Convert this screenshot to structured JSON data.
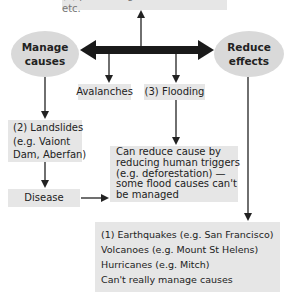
{
  "top_box": {
    "text": "(4) preventing causes of famine etc."
  },
  "nodes": {
    "manage_causes": {
      "line1": "Manage",
      "line2": "causes"
    },
    "reduce_effects": {
      "line1": "Reduce",
      "line2": "effects"
    },
    "avalanches": {
      "text": "Avalanches"
    },
    "flooding": {
      "text": "(3) Flooding"
    },
    "landslides": {
      "lines": [
        "(2) Landslides",
        "(e.g. Vaiont",
        "Dam, Aberfan)"
      ]
    },
    "disease": {
      "text": "Disease"
    },
    "can_reduce": {
      "lines": [
        "Can reduce cause by",
        "reducing human triggers",
        "(e.g. deforestation) —",
        "some flood causes can't",
        "be managed"
      ]
    },
    "bottom": {
      "lines": [
        "(1) Earthquakes (e.g. San Francisco)",
        "Volcanoes (e.g. Mount St Helens)",
        "Hurricanes (e.g. Mitch)",
        "Can't really manage causes"
      ]
    }
  },
  "colors": {
    "box": "#e6e6e6",
    "ellipse": "#d9d9d9",
    "arrow": "#222222"
  }
}
